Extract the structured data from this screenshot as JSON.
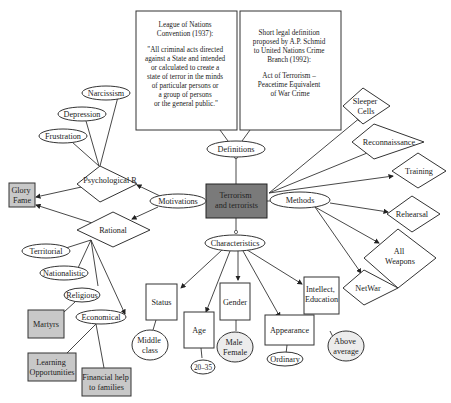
{
  "diagram": {
    "central": {
      "line1": "Terrorism",
      "line2": "and terrorists"
    },
    "definitions": {
      "label": "Definitions",
      "league": {
        "lines": [
          "League of Nations",
          "Convention (1937):",
          "",
          "\"All criminal acts directed",
          "against a State and intended",
          "or calculated to create a",
          "state of terror in the minds",
          "of particular persons or",
          "a group of persons",
          "or the general public.\""
        ]
      },
      "schmid": {
        "lines": [
          "Short legal definition",
          "proposed by A.P. Schmid",
          "to United Nations Crime",
          "Branch (1992):",
          "",
          "Act of Terrorism –",
          "Peacetime Equivalent",
          "of War Crime"
        ]
      }
    },
    "motivations": {
      "label": "Motivations",
      "psychological": {
        "label": "Psychological R",
        "children": [
          "Narcissism",
          "Depression",
          "Frustration"
        ]
      },
      "rational": {
        "label": "Rational",
        "children": [
          "Territorial",
          "Nationalistic",
          "Religious",
          "Economical"
        ]
      },
      "glory": {
        "line1": "Glory",
        "line2": "Fame"
      },
      "martyrs": "Martyrs",
      "learning": {
        "line1": "Learning",
        "line2": "Opportunities"
      },
      "financial": {
        "line1": "Financial help",
        "line2": "to families"
      }
    },
    "methods": {
      "label": "Methods",
      "items": [
        {
          "line1": "Sleeper",
          "line2": "Cells"
        },
        {
          "line1": "Reconnaissance",
          "line2": ""
        },
        {
          "line1": "Training",
          "line2": ""
        },
        {
          "line1": "Rehearsal",
          "line2": ""
        },
        {
          "line1": "All",
          "line2": "Weapons"
        },
        {
          "line1": "NetWar",
          "line2": ""
        }
      ]
    },
    "characteristics": {
      "label": "Characteristics",
      "status": {
        "label": "Status",
        "value1": "Middle",
        "value2": "class"
      },
      "age": {
        "label": "Age",
        "value": "20–35"
      },
      "gender": {
        "label": "Gender",
        "value1": "Male",
        "value2": "Female"
      },
      "appearance": {
        "label": "Appearance",
        "value": "Ordinary"
      },
      "intellect": {
        "line1": "Intellect,",
        "line2": "Education",
        "value1": "Above",
        "value2": "average"
      }
    }
  }
}
